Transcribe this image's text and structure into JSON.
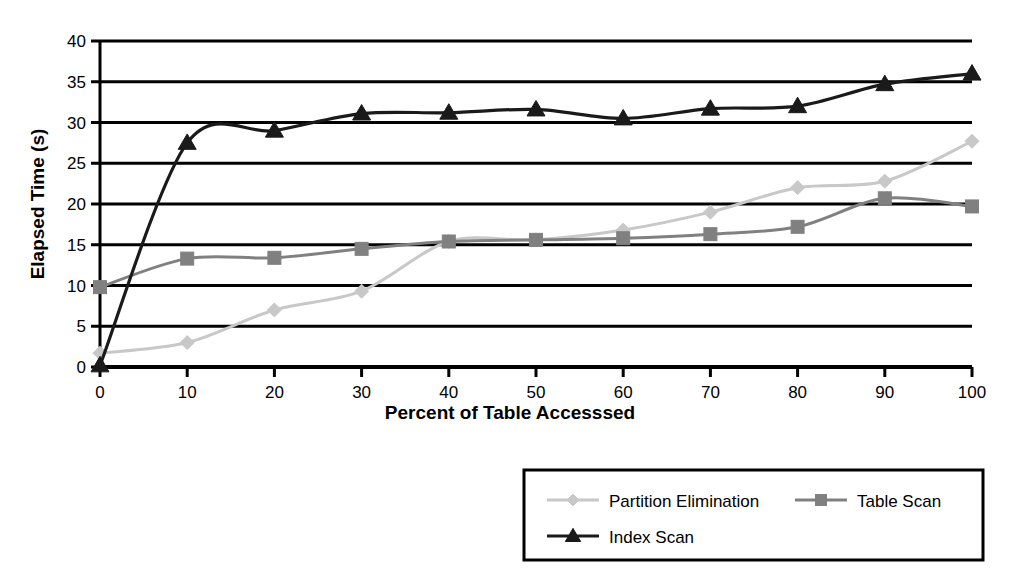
{
  "chart_data": {
    "type": "line",
    "title": "",
    "xlabel": "Percent of Table Accesssed",
    "ylabel": "Elapsed Time (s)",
    "x": [
      0,
      10,
      20,
      30,
      40,
      50,
      60,
      70,
      80,
      90,
      100
    ],
    "xlim": [
      0,
      100
    ],
    "ylim": [
      0,
      40
    ],
    "xticks": [
      "0",
      "10",
      "20",
      "30",
      "40",
      "50",
      "60",
      "70",
      "80",
      "90",
      "100"
    ],
    "yticks": [
      "0",
      "5",
      "10",
      "15",
      "20",
      "25",
      "30",
      "35",
      "40"
    ],
    "grid": "horizontal",
    "legend_position": "bottom-right",
    "series": [
      {
        "name": "Partition Elimination",
        "color": "#c8c8c8",
        "marker": "diamond",
        "values": [
          1.7,
          3.0,
          7.0,
          9.3,
          15.4,
          15.6,
          16.8,
          19.0,
          22.0,
          22.8,
          27.7
        ]
      },
      {
        "name": "Table Scan",
        "color": "#808080",
        "marker": "square",
        "values": [
          9.8,
          13.3,
          13.4,
          14.5,
          15.4,
          15.6,
          15.8,
          16.3,
          17.2,
          20.7,
          19.7
        ]
      },
      {
        "name": "Index Scan",
        "color": "#1a1a1a",
        "marker": "triangle",
        "values": [
          0.2,
          27.5,
          29.0,
          31.1,
          31.2,
          31.6,
          30.5,
          31.7,
          32.0,
          34.7,
          36.0
        ]
      }
    ]
  },
  "legend": {
    "items": [
      {
        "label": "Partition Elimination"
      },
      {
        "label": "Table Scan"
      },
      {
        "label": "Index Scan"
      }
    ]
  }
}
